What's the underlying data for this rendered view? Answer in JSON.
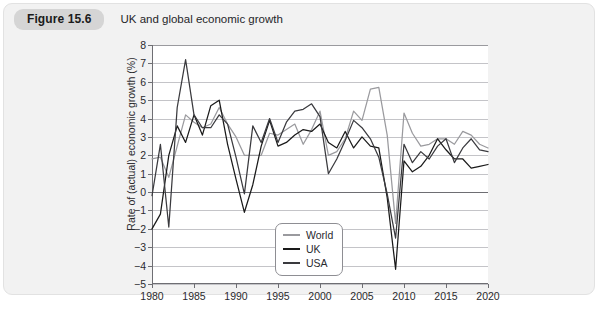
{
  "figure": {
    "badge": "Figure 15.6",
    "title": "UK and global economic growth"
  },
  "chart_data": {
    "type": "line",
    "title": "UK and global economic growth",
    "xlabel": "",
    "ylabel": "Rate of (actual) economic growth (%)",
    "xlim": [
      1980,
      2020
    ],
    "ylim": [
      -5,
      8
    ],
    "ytick_step": 1,
    "xtick_step": 5,
    "grid": true,
    "legend_position": "inside-bottom-left",
    "xticks": [
      1980,
      1985,
      1990,
      1995,
      2000,
      2005,
      2010,
      2015,
      2020
    ],
    "yticks": [
      -5,
      -4,
      -3,
      -2,
      -1,
      0,
      1,
      2,
      3,
      4,
      5,
      6,
      7,
      8
    ],
    "x": [
      1980,
      1981,
      1982,
      1983,
      1984,
      1985,
      1986,
      1987,
      1988,
      1989,
      1990,
      1991,
      1992,
      1993,
      1994,
      1995,
      1996,
      1997,
      1998,
      1999,
      2000,
      2001,
      2002,
      2003,
      2004,
      2005,
      2006,
      2007,
      2008,
      2009,
      2010,
      2011,
      2012,
      2013,
      2014,
      2015,
      2016,
      2017,
      2018,
      2019,
      2020
    ],
    "series": [
      {
        "name": "World",
        "color": "#9a9a9e",
        "values": [
          1.8,
          1.9,
          0.8,
          2.5,
          4.2,
          3.8,
          3.5,
          3.7,
          4.6,
          3.7,
          3.0,
          2.0,
          2.0,
          2.0,
          3.2,
          3.1,
          3.4,
          3.7,
          2.6,
          3.4,
          4.4,
          2.0,
          2.2,
          2.9,
          4.4,
          3.9,
          5.6,
          5.7,
          3.1,
          -1.7,
          4.3,
          3.2,
          2.5,
          2.6,
          2.9,
          2.9,
          2.6,
          3.3,
          3.1,
          2.6,
          2.4
        ],
        "values_note": "light grey upper line, settles near 3.5-4 after 2010"
      },
      {
        "name": "UK",
        "color": "#1a1a1a",
        "values": [
          -2.0,
          -1.2,
          2.0,
          3.6,
          2.7,
          4.2,
          3.1,
          4.7,
          5.0,
          2.6,
          0.7,
          -1.1,
          0.4,
          2.5,
          3.9,
          2.5,
          2.7,
          3.1,
          3.4,
          3.3,
          3.7,
          2.7,
          2.4,
          3.3,
          2.4,
          3.0,
          2.5,
          2.4,
          -0.3,
          -4.2,
          1.7,
          1.1,
          1.4,
          2.0,
          2.9,
          2.3,
          1.8,
          1.8,
          1.3,
          1.4,
          1.5
        ],
        "values_note": "black line, deepest 2009 trough at about -4.2"
      },
      {
        "name": "USA",
        "color": "#3a3a3e",
        "values": [
          -0.2,
          2.6,
          -1.9,
          4.6,
          7.2,
          4.2,
          3.5,
          3.5,
          4.2,
          3.7,
          1.9,
          -0.1,
          3.6,
          2.7,
          4.0,
          2.7,
          3.8,
          4.4,
          4.5,
          4.8,
          4.1,
          1.0,
          1.8,
          2.8,
          3.9,
          3.5,
          2.9,
          1.9,
          -0.1,
          -2.5,
          2.6,
          1.6,
          2.2,
          1.8,
          2.5,
          2.9,
          1.6,
          2.4,
          2.9,
          2.3,
          2.2
        ],
        "values_note": "dark grey line, 1984 peak at about 7.2"
      }
    ]
  },
  "legend": {
    "items": [
      {
        "label": "World",
        "color": "#9a9a9e"
      },
      {
        "label": "UK",
        "color": "#1a1a1a"
      },
      {
        "label": "USA",
        "color": "#3a3a3e"
      }
    ]
  }
}
